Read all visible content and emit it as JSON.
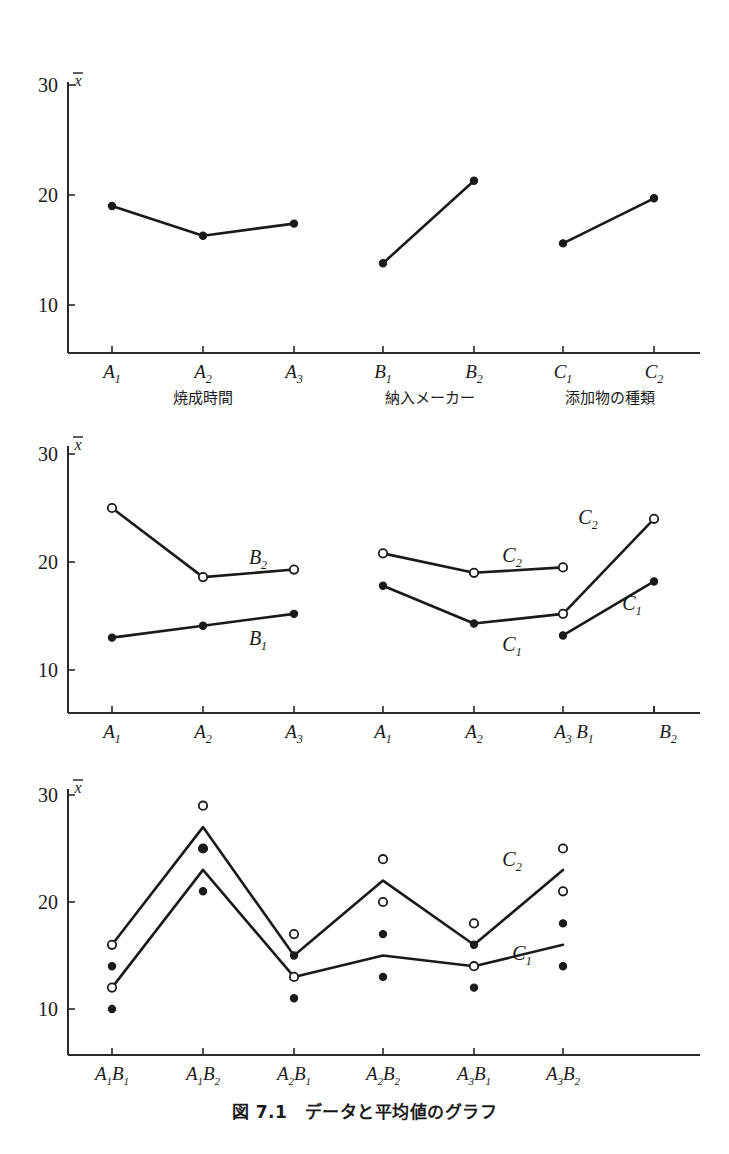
{
  "figure": {
    "caption": "図 7.1　データと平均値のグラフ",
    "y_axis_symbol": "x̄"
  },
  "chart_data": [
    {
      "type": "line",
      "id": "chart-1-main-effects",
      "title": "",
      "ylabel": "x̄",
      "xlabel": "",
      "ylim": [
        5,
        31
      ],
      "yticks": [
        10,
        20,
        30
      ],
      "ytick_labels": [
        "10",
        "20",
        "30"
      ],
      "grid": false,
      "legend": "none",
      "categories": [
        "A1",
        "A2",
        "A3",
        "B1",
        "B2",
        "C1",
        "C2"
      ],
      "category_labels": [
        {
          "base": "A",
          "sub": "1"
        },
        {
          "base": "A",
          "sub": "2"
        },
        {
          "base": "A",
          "sub": "3"
        },
        {
          "base": "B",
          "sub": "1"
        },
        {
          "base": "B",
          "sub": "2"
        },
        {
          "base": "C",
          "sub": "1"
        },
        {
          "base": "C",
          "sub": "2"
        }
      ],
      "group_labels": [
        "焼成時間",
        "納入メーカー",
        "添加物の種類"
      ],
      "series": [
        {
          "name": "factor-A",
          "marker": "filled",
          "x": [
            "A1",
            "A2",
            "A3"
          ],
          "values": [
            19.0,
            16.3,
            17.4
          ]
        },
        {
          "name": "factor-B",
          "marker": "filled",
          "x": [
            "B1",
            "B2"
          ],
          "values": [
            13.8,
            21.3
          ]
        },
        {
          "name": "factor-C",
          "marker": "filled",
          "x": [
            "C1",
            "C2"
          ],
          "values": [
            15.6,
            19.7
          ]
        }
      ]
    },
    {
      "type": "line",
      "id": "chart-2-two-factor-interactions",
      "title": "",
      "ylabel": "x̄",
      "xlabel": "",
      "ylim": [
        5,
        31
      ],
      "yticks": [
        10,
        20,
        30
      ],
      "ytick_labels": [
        "10",
        "20",
        "30"
      ],
      "grid": false,
      "legend": "inline-labels",
      "categories": [
        "A1",
        "A2",
        "A3",
        "A1",
        "A2",
        "A3",
        "B1",
        "B2"
      ],
      "category_labels": [
        {
          "base": "A",
          "sub": "1"
        },
        {
          "base": "A",
          "sub": "2"
        },
        {
          "base": "A",
          "sub": "3"
        },
        {
          "base": "A",
          "sub": "1"
        },
        {
          "base": "A",
          "sub": "2"
        },
        {
          "base": "A",
          "sub": "3"
        },
        {
          "base": "B",
          "sub": "1"
        },
        {
          "base": "B",
          "sub": "2"
        }
      ],
      "series": [
        {
          "name": "B2",
          "label": {
            "base": "B",
            "sub": "2"
          },
          "marker": "open",
          "group": 0,
          "x": [
            "A1",
            "A2",
            "A3"
          ],
          "values": [
            25.0,
            18.6,
            19.3
          ]
        },
        {
          "name": "B1",
          "label": {
            "base": "B",
            "sub": "1"
          },
          "marker": "filled",
          "group": 0,
          "x": [
            "A1",
            "A2",
            "A3"
          ],
          "values": [
            13.0,
            14.1,
            15.2
          ]
        },
        {
          "name": "C2-over-A",
          "label": {
            "base": "C",
            "sub": "2"
          },
          "marker": "open",
          "group": 1,
          "x": [
            "A1",
            "A2",
            "A3"
          ],
          "values": [
            20.8,
            19.0,
            19.5
          ]
        },
        {
          "name": "C1-over-A",
          "label": {
            "base": "C",
            "sub": "1"
          },
          "marker": "filled",
          "group": 1,
          "x": [
            "A1",
            "A2",
            "A3"
          ],
          "values": [
            17.8,
            14.3,
            15.2
          ]
        },
        {
          "name": "C2-over-B",
          "label": {
            "base": "C",
            "sub": "2"
          },
          "marker": "open",
          "group": 2,
          "x": [
            "B1",
            "B2"
          ],
          "values": [
            15.2,
            24.0
          ]
        },
        {
          "name": "C1-over-B",
          "label": {
            "base": "C",
            "sub": "1"
          },
          "marker": "filled",
          "group": 2,
          "x": [
            "B1",
            "B2"
          ],
          "values": [
            13.2,
            18.2
          ]
        }
      ]
    },
    {
      "type": "line",
      "id": "chart-3-raw-data-and-means",
      "title": "",
      "ylabel": "x̄",
      "xlabel": "",
      "ylim": [
        5,
        31
      ],
      "yticks": [
        10,
        20,
        30
      ],
      "ytick_labels": [
        "10",
        "20",
        "30"
      ],
      "grid": false,
      "legend": "inline-labels",
      "categories": [
        "A1B1",
        "A1B2",
        "A2B1",
        "A2B2",
        "A3B1",
        "A3B2"
      ],
      "category_labels": [
        {
          "a": "A",
          "asub": "1",
          "b": "B",
          "bsub": "1"
        },
        {
          "a": "A",
          "asub": "1",
          "b": "B",
          "bsub": "2"
        },
        {
          "a": "A",
          "asub": "2",
          "b": "B",
          "bsub": "1"
        },
        {
          "a": "A",
          "asub": "2",
          "b": "B",
          "bsub": "2"
        },
        {
          "a": "A",
          "asub": "3",
          "b": "B",
          "bsub": "1"
        },
        {
          "a": "A",
          "asub": "3",
          "b": "B",
          "bsub": "2"
        }
      ],
      "series": [
        {
          "name": "C2",
          "label": {
            "base": "C",
            "sub": "2"
          },
          "kind": "mean-line",
          "values": [
            16,
            27,
            15,
            22,
            16,
            23
          ]
        },
        {
          "name": "C1",
          "label": {
            "base": "C",
            "sub": "1"
          },
          "kind": "mean-line",
          "values": [
            12,
            23,
            13,
            15,
            14,
            16
          ]
        },
        {
          "name": "C2-observations",
          "kind": "points",
          "marker": "open",
          "values": [
            [
              16,
              12
            ],
            [
              29,
              25
            ],
            [
              17,
              13
            ],
            [
              24,
              20
            ],
            [
              18,
              14
            ],
            [
              25,
              21
            ]
          ]
        },
        {
          "name": "C1-observations",
          "kind": "points",
          "marker": "filled",
          "values": [
            [
              14,
              10
            ],
            [
              25,
              21
            ],
            [
              15,
              11
            ],
            [
              17,
              13
            ],
            [
              16,
              12
            ],
            [
              18,
              14
            ]
          ]
        }
      ]
    }
  ]
}
